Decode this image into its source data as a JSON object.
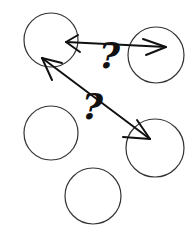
{
  "diagram": {
    "nodes": [
      {
        "id": "top-left",
        "cx": 51,
        "cy": 40,
        "r": 27
      },
      {
        "id": "top-right",
        "cx": 156,
        "cy": 55,
        "r": 28
      },
      {
        "id": "middle-left",
        "cx": 51,
        "cy": 133,
        "r": 27
      },
      {
        "id": "middle-right",
        "cx": 155,
        "cy": 147,
        "r": 29
      },
      {
        "id": "bottom",
        "cx": 93,
        "cy": 196,
        "r": 28
      }
    ],
    "edges": [
      {
        "from": "top-left",
        "to": "top-right",
        "label": "?"
      },
      {
        "from": "top-left",
        "to": "middle-right",
        "label": "?"
      }
    ],
    "colors": {
      "stroke": "#222222",
      "background": "#ffffff"
    }
  }
}
